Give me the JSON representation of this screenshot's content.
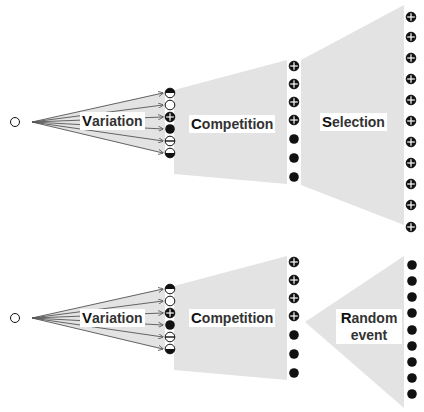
{
  "colors": {
    "shade": "#e3e3e3",
    "ink": "#111111",
    "arrow": "#555555"
  },
  "panels": [
    {
      "name": "natural-selection",
      "stages": [
        {
          "cap": "V",
          "rest": "ariation"
        },
        {
          "cap": "C",
          "rest": "ompetition"
        },
        {
          "cap": "S",
          "rest": "election"
        }
      ],
      "variation_symbols": [
        "half-top",
        "empty",
        "plus",
        "filled",
        "minus",
        "half-bottom"
      ],
      "competition_symbols": [
        "plus",
        "plus",
        "plus",
        "plus",
        "filled",
        "filled",
        "filled"
      ],
      "final_symbols": [
        "plus",
        "plus",
        "plus",
        "plus",
        "plus",
        "plus",
        "plus",
        "plus",
        "plus",
        "plus",
        "plus"
      ]
    },
    {
      "name": "genetic-drift",
      "stages": [
        {
          "cap": "V",
          "rest": "ariation"
        },
        {
          "cap": "C",
          "rest": "ompetition"
        },
        {
          "cap": "R",
          "rest": "andom",
          "line2": "event"
        }
      ],
      "variation_symbols": [
        "half-top",
        "empty",
        "plus",
        "filled",
        "minus",
        "half-bottom"
      ],
      "competition_symbols": [
        "plus",
        "plus",
        "plus",
        "plus",
        "filled",
        "filled",
        "filled"
      ],
      "final_symbols": [
        "filled",
        "filled",
        "filled",
        "filled",
        "filled",
        "filled",
        "filled",
        "filled",
        "filled"
      ]
    }
  ]
}
